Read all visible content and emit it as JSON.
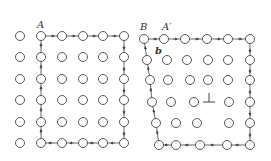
{
  "labels": {
    "left_A": "A",
    "right_B": "B",
    "right_A_prime": "A′",
    "right_b": "b",
    "dislocation_symbol": "⊥"
  },
  "colors": {
    "stroke": "#444444",
    "background": "#ffffff"
  },
  "left_grid": {
    "description": "perfect lattice Burgers circuit",
    "circles": [
      [
        20,
        36
      ],
      [
        41,
        36
      ],
      [
        62,
        36
      ],
      [
        83,
        36
      ],
      [
        103,
        36
      ],
      [
        124,
        36
      ],
      [
        20,
        57
      ],
      [
        41,
        57
      ],
      [
        62,
        57
      ],
      [
        83,
        57
      ],
      [
        103,
        57
      ],
      [
        124,
        57
      ],
      [
        20,
        79
      ],
      [
        41,
        79
      ],
      [
        62,
        79
      ],
      [
        83,
        79
      ],
      [
        103,
        79
      ],
      [
        124,
        79
      ],
      [
        20,
        100
      ],
      [
        41,
        100
      ],
      [
        62,
        100
      ],
      [
        83,
        100
      ],
      [
        103,
        100
      ],
      [
        124,
        100
      ],
      [
        20,
        122
      ],
      [
        41,
        122
      ],
      [
        62,
        122
      ],
      [
        83,
        122
      ],
      [
        103,
        122
      ],
      [
        124,
        122
      ],
      [
        20,
        143
      ],
      [
        41,
        143
      ],
      [
        62,
        143
      ],
      [
        83,
        143
      ],
      [
        103,
        143
      ],
      [
        124,
        143
      ]
    ],
    "circuit": [
      [
        41,
        143
      ],
      [
        41,
        122
      ],
      [
        41,
        100
      ],
      [
        41,
        79
      ],
      [
        41,
        57
      ],
      [
        41,
        36
      ],
      [
        62,
        36
      ],
      [
        83,
        36
      ],
      [
        103,
        36
      ],
      [
        124,
        36
      ],
      [
        124,
        57
      ],
      [
        124,
        79
      ],
      [
        124,
        100
      ],
      [
        124,
        122
      ],
      [
        124,
        143
      ],
      [
        103,
        143
      ],
      [
        83,
        143
      ],
      [
        62,
        143
      ],
      [
        41,
        143
      ]
    ]
  },
  "right_grid": {
    "description": "lattice containing edge dislocation",
    "circles": [
      [
        144,
        39
      ],
      [
        164,
        39
      ],
      [
        185,
        39
      ],
      [
        207,
        39
      ],
      [
        228,
        39
      ],
      [
        250,
        39
      ],
      [
        147,
        60
      ],
      [
        167,
        60
      ],
      [
        187,
        60
      ],
      [
        208,
        60
      ],
      [
        228,
        60
      ],
      [
        250,
        60
      ],
      [
        150,
        80
      ],
      [
        168,
        80
      ],
      [
        190,
        80
      ],
      [
        208,
        80
      ],
      [
        228,
        80
      ],
      [
        250,
        80
      ],
      [
        152,
        102
      ],
      [
        171,
        102
      ],
      [
        194,
        102
      ],
      [
        229,
        102
      ],
      [
        250,
        102
      ],
      [
        156,
        123
      ],
      [
        176,
        123
      ],
      [
        197,
        123
      ],
      [
        229,
        123
      ],
      [
        250,
        123
      ],
      [
        159,
        145
      ],
      [
        176,
        145
      ],
      [
        200,
        145
      ],
      [
        227,
        145
      ],
      [
        250,
        145
      ]
    ],
    "circuit": [
      [
        144,
        39
      ],
      [
        164,
        39
      ],
      [
        185,
        39
      ],
      [
        207,
        39
      ],
      [
        228,
        39
      ],
      [
        250,
        39
      ],
      [
        250,
        60
      ],
      [
        250,
        80
      ],
      [
        250,
        102
      ],
      [
        250,
        123
      ],
      [
        250,
        145
      ],
      [
        227,
        145
      ],
      [
        200,
        145
      ],
      [
        176,
        145
      ],
      [
        159,
        145
      ],
      [
        156,
        123
      ],
      [
        152,
        102
      ],
      [
        150,
        80
      ],
      [
        147,
        60
      ],
      [
        144,
        39
      ]
    ],
    "dislocation": [
      209,
      100
    ]
  }
}
